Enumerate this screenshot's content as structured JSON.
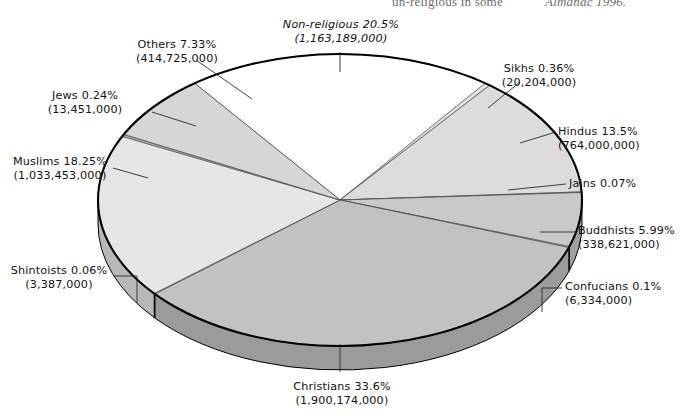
{
  "page": {
    "top_clipped_text": {
      "fragment_left": "un-religious in some",
      "fragment_right": "Almanac 1996."
    }
  },
  "chart_data": {
    "type": "pie",
    "title": "",
    "style": "3d-exploded-pie",
    "legend": "labels-with-leader-lines",
    "unit": "percent of world population",
    "categories": [
      "Non-religious",
      "Sikhs",
      "Hindus",
      "Jains",
      "Buddhists",
      "Confucians",
      "Christians",
      "Shintoists",
      "Muslims",
      "Jews",
      "Others"
    ],
    "values": [
      20.5,
      0.36,
      13.5,
      0.07,
      5.99,
      0.1,
      33.6,
      0.06,
      18.25,
      0.24,
      7.33
    ],
    "counts": [
      1163189000,
      20204000,
      764000000,
      null,
      338621000,
      6334000,
      1900174000,
      3387000,
      1033453000,
      13451000,
      414725000
    ],
    "slices": [
      {
        "name": "Non-religious",
        "percent_label": "20.5%",
        "count_label": "(1,163,189,000)",
        "italic": true,
        "color": "#ffffff"
      },
      {
        "name": "Sikhs",
        "percent_label": "0.36%",
        "count_label": "(20,204,000)",
        "italic": false,
        "color": "#e3e3e3"
      },
      {
        "name": "Hindus",
        "percent_label": "13.5%",
        "count_label": "(764,000,000)",
        "italic": false,
        "color": "#dcdcdc"
      },
      {
        "name": "Jains",
        "percent_label": "0.07%",
        "count_label": "",
        "italic": false,
        "color": "#b4b4b4"
      },
      {
        "name": "Buddhists",
        "percent_label": "5.99%",
        "count_label": "(338,621,000)",
        "italic": false,
        "color": "#c9c9c9"
      },
      {
        "name": "Confucians",
        "percent_label": "0.1%",
        "count_label": "(6,334,000)",
        "italic": false,
        "color": "#d8d8d8"
      },
      {
        "name": "Christians",
        "percent_label": "33.6%",
        "count_label": "(1,900,174,000)",
        "italic": false,
        "color": "#c2c2c2"
      },
      {
        "name": "Shintoists",
        "percent_label": "0.06%",
        "count_label": "(3,387,000)",
        "italic": false,
        "color": "#d8d8d8"
      },
      {
        "name": "Muslims",
        "percent_label": "18.25%",
        "count_label": "(1,033,453,000)",
        "italic": false,
        "color": "#e6e6e6"
      },
      {
        "name": "Jews",
        "percent_label": "0.24%",
        "count_label": "(13,451,000)",
        "italic": false,
        "color": "#b0b0b0"
      },
      {
        "name": "Others",
        "percent_label": "7.33%",
        "count_label": "(414,725,000)",
        "italic": false,
        "color": "#d6d6d6"
      }
    ]
  },
  "labels": {
    "non_religious": {
      "name": "Non-religious",
      "percent": "20.5%",
      "count": "(1,163,189,000)"
    },
    "others": {
      "name": "Others",
      "percent": "7.33%",
      "count": "(414,725,000)"
    },
    "jews": {
      "name": "Jews",
      "percent": "0.24%",
      "count": "(13,451,000)"
    },
    "muslims": {
      "name": "Muslims",
      "percent": "18.25%",
      "count": "(1,033,453,000)"
    },
    "shintoists": {
      "name": "Shintoists",
      "percent": "0.06%",
      "count": "(3,387,000)"
    },
    "christians": {
      "name": "Christians",
      "percent": "33.6%",
      "count": "(1,900,174,000)"
    },
    "confucians": {
      "name": "Confucians",
      "percent": "0.1%",
      "count": "(6,334,000)"
    },
    "buddhists": {
      "name": "Buddhists",
      "percent": "5.99%",
      "count": "(338,621,000)"
    },
    "jains": {
      "name": "Jains",
      "percent": "0.07%",
      "count": ""
    },
    "hindus": {
      "name": "Hindus",
      "percent": "13.5%",
      "count": "(764,000,000)"
    },
    "sikhs": {
      "name": "Sikhs",
      "percent": "0.36%",
      "count": "(20,204,000)"
    }
  },
  "colors": {
    "outline": "#000000",
    "page_background": "#ffffff",
    "slice_light": "#e6e6e6",
    "slice_mid": "#c2c2c2",
    "slice_dark": "#b0b0b0"
  }
}
